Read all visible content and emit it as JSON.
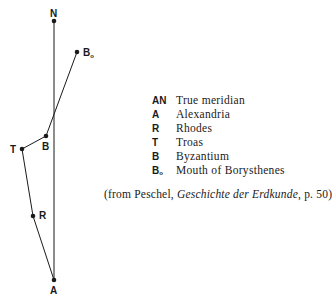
{
  "diagram": {
    "points": [
      {
        "id": "N",
        "label": "N",
        "sub": "",
        "x": 54,
        "y": 21
      },
      {
        "id": "B0",
        "label": "B",
        "sub": "o",
        "x": 77,
        "y": 52
      },
      {
        "id": "B",
        "label": "B",
        "sub": "",
        "x": 46,
        "y": 136
      },
      {
        "id": "T",
        "label": "T",
        "sub": "",
        "x": 22,
        "y": 149
      },
      {
        "id": "R",
        "label": "R",
        "sub": "",
        "x": 33,
        "y": 216
      },
      {
        "id": "A",
        "label": "A",
        "sub": "",
        "x": 54,
        "y": 280
      }
    ],
    "lines": [
      [
        "A",
        "N"
      ],
      [
        "A",
        "R"
      ],
      [
        "R",
        "T"
      ],
      [
        "T",
        "B"
      ],
      [
        "B",
        "B0"
      ]
    ],
    "line_color": "#1a1a1a"
  },
  "legend": {
    "items": [
      {
        "key": "AN",
        "sub": "",
        "text": "True meridian"
      },
      {
        "key": "A",
        "sub": "",
        "text": "Alexandria"
      },
      {
        "key": "R",
        "sub": "",
        "text": "Rhodes"
      },
      {
        "key": "T",
        "sub": "",
        "text": "Troas"
      },
      {
        "key": "B",
        "sub": "",
        "text": "Byzantium"
      },
      {
        "key": "B",
        "sub": "o",
        "text": "Mouth of Borysthenes"
      }
    ]
  },
  "caption": {
    "prefix": "(from Peschel, ",
    "title": "Geschichte der Erdkunde",
    "suffix": ", p. 50)"
  }
}
